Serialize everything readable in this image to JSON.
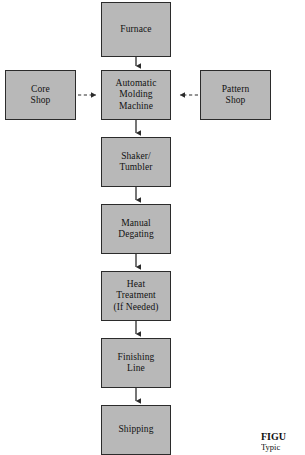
{
  "figure": {
    "type": "process-flowchart",
    "orientation": "vertical",
    "style": {
      "node_fill": "#b8b8b8",
      "node_border": "#2b2b2b",
      "text_color": "#121212",
      "background": "#ffffff",
      "connector_color": "#2b2b2b"
    }
  },
  "nodes": {
    "furnace": {
      "label": "Furnace"
    },
    "automatic_molding_machine": {
      "label": "Automatic\nMolding\nMachine"
    },
    "core_shop": {
      "label": "Core\nShop"
    },
    "pattern_shop": {
      "label": "Pattern\nShop"
    },
    "shaker_tumbler": {
      "label": "Shaker/\nTumbler"
    },
    "manual_degating": {
      "label": "Manual\nDegating"
    },
    "heat_treatment": {
      "label": "Heat\nTreatment\n(If Needed)"
    },
    "finishing_line": {
      "label": "Finishing\nLine"
    },
    "shipping": {
      "label": "Shipping"
    }
  },
  "connectors": [
    {
      "from": "furnace",
      "to": "automatic_molding_machine",
      "style": "solid",
      "direction": "down"
    },
    {
      "from": "core_shop",
      "to": "automatic_molding_machine",
      "style": "dashed",
      "direction": "right"
    },
    {
      "from": "pattern_shop",
      "to": "automatic_molding_machine",
      "style": "dashed",
      "direction": "left"
    },
    {
      "from": "automatic_molding_machine",
      "to": "shaker_tumbler",
      "style": "solid",
      "direction": "down"
    },
    {
      "from": "shaker_tumbler",
      "to": "manual_degating",
      "style": "solid",
      "direction": "down"
    },
    {
      "from": "manual_degating",
      "to": "heat_treatment",
      "style": "solid",
      "direction": "down"
    },
    {
      "from": "heat_treatment",
      "to": "finishing_line",
      "style": "solid",
      "direction": "down"
    },
    {
      "from": "finishing_line",
      "to": "shipping",
      "style": "solid",
      "direction": "down"
    }
  ],
  "caption": {
    "title": "FIGU",
    "subtitle": "Typic"
  }
}
